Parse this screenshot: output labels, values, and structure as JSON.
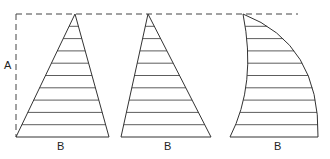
{
  "diagram": {
    "labels": {
      "height": "A",
      "base_1": "B",
      "base_2": "B",
      "base_3": "B"
    },
    "shapes": [
      {
        "name": "symmetric-triangle",
        "apex": [
          75,
          14
        ],
        "base_left": [
          16,
          137
        ],
        "base_right": [
          109,
          137
        ]
      },
      {
        "name": "skewed-triangle",
        "apex": [
          148,
          14
        ],
        "base_left": [
          121,
          137
        ],
        "base_right": [
          211,
          137
        ]
      },
      {
        "name": "curved-sail",
        "apex": [
          243,
          14
        ],
        "base_left": [
          230,
          137
        ],
        "base_right": [
          318,
          137
        ]
      }
    ],
    "hatch_count": 10,
    "colors": {
      "stroke": "#333333",
      "dash": "#444444",
      "background": "#ffffff"
    }
  }
}
